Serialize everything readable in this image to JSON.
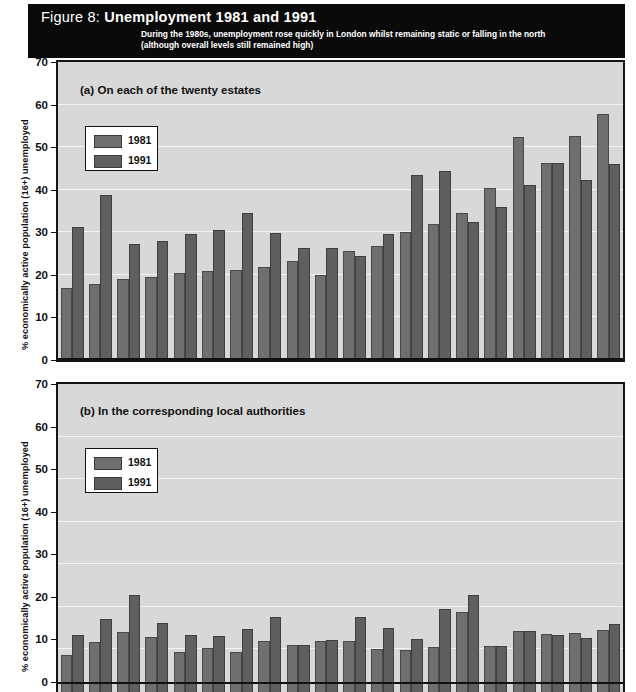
{
  "figure": {
    "number_label": "Figure 8: ",
    "title": "Unemployment 1981 and 1991",
    "subtitle_line1": "During the 1980s, unemployment rose quickly in London whilst remaining static or falling in the north",
    "subtitle_line2": "(although overall levels still remained high)"
  },
  "colors": {
    "banner_bg": "#0a0a0a",
    "plot_bg": "#d8d8d8",
    "bar_1981": "#6f6f6f",
    "bar_1991": "#5f5f5f",
    "gridline": "#f4f4f4",
    "axis": "#111111"
  },
  "chart_data": [
    {
      "id": "panel-a",
      "type": "bar",
      "title": "(a) On each of the twenty estates",
      "xlabel": "",
      "ylabel": "% economically active population (16+) unemployed",
      "ylim": [
        0,
        70
      ],
      "yticks": [
        0,
        10,
        20,
        30,
        40,
        50,
        60,
        70
      ],
      "grid": true,
      "legend_position": "upper-left",
      "categories": [
        "1",
        "2",
        "3",
        "4",
        "5",
        "6",
        "7",
        "8",
        "9",
        "10",
        "11",
        "12",
        "13",
        "14",
        "15",
        "16",
        "17",
        "18",
        "19",
        "20"
      ],
      "series": [
        {
          "name": "1981",
          "values": [
            17.0,
            17.8,
            19.0,
            19.5,
            20.5,
            21.0,
            21.2,
            21.8,
            23.2,
            20.0,
            25.5,
            26.8,
            30.0,
            32.0,
            34.5,
            40.5,
            52.3,
            46.3,
            52.7,
            57.8
          ]
        },
        {
          "name": "1991",
          "values": [
            31.2,
            38.8,
            27.3,
            28.0,
            29.5,
            30.5,
            34.5,
            29.8,
            26.3,
            26.3,
            24.5,
            29.5,
            43.5,
            44.5,
            32.5,
            36.0,
            41.0,
            46.3,
            42.3,
            46.0
          ]
        }
      ]
    },
    {
      "id": "panel-b",
      "type": "bar",
      "title": "(b) In the corresponding local authorities",
      "xlabel": "",
      "ylabel": "% economically active population (16+) unemployed",
      "ylim": [
        0,
        70
      ],
      "yticks": [
        0,
        10,
        20,
        30,
        40,
        50,
        60,
        70
      ],
      "grid": true,
      "legend_position": "upper-left",
      "categories": [
        "1",
        "2",
        "3",
        "4",
        "5",
        "6",
        "7",
        "8",
        "9",
        "10",
        "11",
        "12",
        "13",
        "14",
        "15",
        "16",
        "17",
        "18",
        "19",
        "20"
      ],
      "series": [
        {
          "name": "1981",
          "values": [
            8.8,
            11.8,
            14.0,
            13.0,
            9.5,
            10.3,
            9.4,
            12.0,
            11.0,
            12.0,
            12.0,
            10.2,
            9.8,
            10.6,
            18.7,
            10.9,
            14.4,
            13.6,
            13.9,
            14.6
          ]
        },
        {
          "name": "1991",
          "values": [
            13.5,
            17.2,
            22.7,
            16.3,
            13.5,
            13.2,
            14.8,
            17.6,
            11.0,
            12.2,
            17.7,
            15.0,
            12.4,
            19.4,
            22.9,
            10.9,
            14.4,
            13.5,
            12.7,
            16.0
          ]
        }
      ]
    }
  ],
  "legend": {
    "items": [
      {
        "label": "1981",
        "color": "#6f6f6f"
      },
      {
        "label": "1991",
        "color": "#5f5f5f"
      }
    ]
  }
}
